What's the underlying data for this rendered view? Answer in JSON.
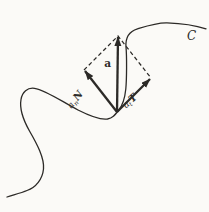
{
  "figure": {
    "colors": {
      "ink": "#2c2a27",
      "background": "#fbfaf7"
    },
    "labels": {
      "acceleration": {
        "text": "a"
      },
      "normal_component": {
        "base": "a",
        "sub": "n",
        "unit": "N"
      },
      "tangential_component": {
        "base": "a",
        "sub": "t",
        "unit": "T"
      },
      "curve": {
        "text": "C"
      }
    }
  }
}
